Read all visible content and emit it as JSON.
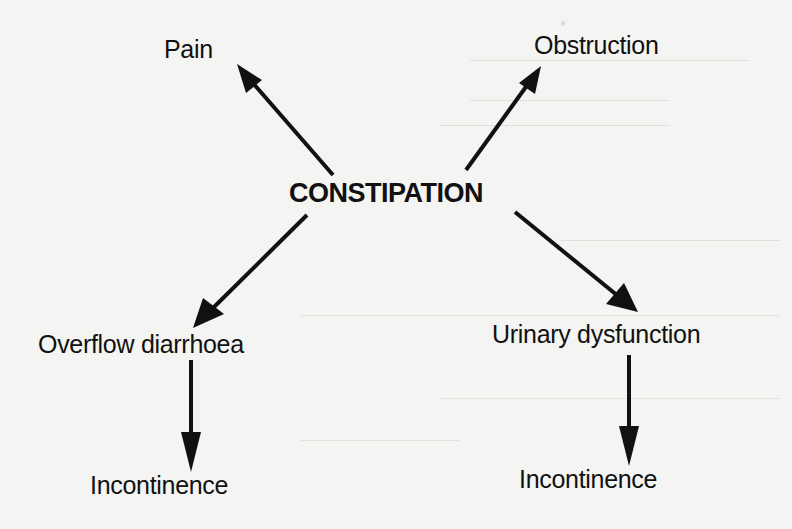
{
  "diagram": {
    "center": "CONSTIPATION",
    "nodes": {
      "pain": "Pain",
      "obstruction": "Obstruction",
      "overflow": "Overflow diarrhoea",
      "urinary": "Urinary dysfunction",
      "incontinence_left": "Incontinence",
      "incontinence_right": "Incontinence"
    },
    "edges": [
      {
        "from": "CONSTIPATION",
        "to": "Pain"
      },
      {
        "from": "CONSTIPATION",
        "to": "Obstruction"
      },
      {
        "from": "CONSTIPATION",
        "to": "Overflow diarrhoea"
      },
      {
        "from": "CONSTIPATION",
        "to": "Urinary dysfunction"
      },
      {
        "from": "Overflow diarrhoea",
        "to": "Incontinence"
      },
      {
        "from": "Urinary dysfunction",
        "to": "Incontinence"
      }
    ],
    "colors": {
      "background": "#f4f4f2",
      "ink": "#111111"
    }
  }
}
